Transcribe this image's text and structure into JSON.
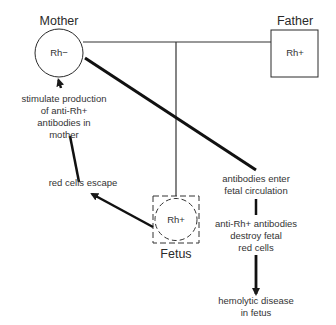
{
  "diagram": {
    "nodes": {
      "mother": {
        "label": "Mother",
        "genotype": "Rh−",
        "shape": "circle"
      },
      "father": {
        "label": "Father",
        "genotype": "Rh+",
        "shape": "square"
      },
      "fetus": {
        "label": "Fetus",
        "genotype": "Rh+",
        "shape": "dashed-square-with-dashed-circle"
      }
    },
    "steps": {
      "red_cells_escape": "red cells escape",
      "stimulate": [
        "stimulate production",
        "of anti-Rh+",
        "antibodies in",
        "mother"
      ],
      "antibodies_enter": [
        "antibodies enter",
        "fetal circulation"
      ],
      "destroy": [
        "anti-Rh+ antibodies",
        "destroy fetal",
        "red cells"
      ],
      "disease": [
        "hemolytic disease",
        "in fetus"
      ]
    },
    "colors": {
      "line": "#1a1a1a",
      "text": "#333333",
      "background": "#ffffff"
    }
  }
}
